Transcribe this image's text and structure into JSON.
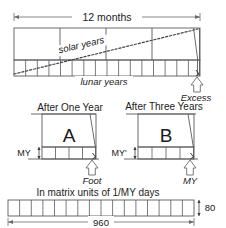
{
  "figure": {
    "title_top": "12 months",
    "label_solar": "solar years",
    "label_lunar": "lunar years",
    "label_excess": "Excess",
    "panel_a": {
      "heading": "After One Year",
      "letter": "A",
      "left_label": "MY",
      "arrow_label": "Foot",
      "cells": 4
    },
    "panel_b": {
      "heading": "After Three Years",
      "letter": "B",
      "left_label": "MY'",
      "arrow_label": "MY",
      "cells": 4
    },
    "bottom": {
      "heading": "In matrix units of 1/MY days",
      "width_label": "960",
      "height_label": "80",
      "cells": 16
    },
    "top_bar": {
      "solar_cells": 4,
      "lunar_cells": 16
    },
    "colors": {
      "stroke": "#3a3a3a",
      "stroke_light": "#8a8a8a",
      "text": "#1a1a1a",
      "background": "#ffffff"
    }
  }
}
